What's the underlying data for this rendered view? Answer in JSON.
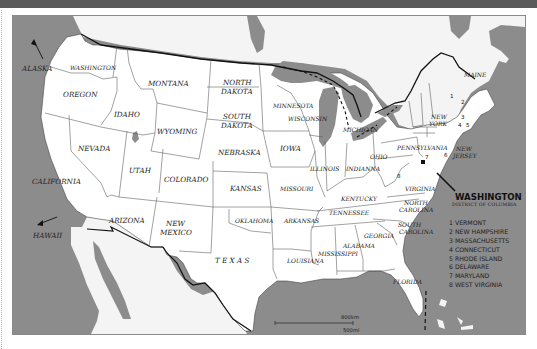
{
  "colors": {
    "water": "#8c8c8c",
    "land": "#ffffff",
    "foreign_land": "#f4f4f4",
    "border": "#555555",
    "national_border": "#111111",
    "header_bar": "#5a5a5a"
  },
  "map": {
    "title": "United States of America",
    "outside_labels": {
      "alaska": "ALASKA",
      "hawaii": "HAWAII"
    },
    "states": {
      "washington": "WASHINGTON",
      "oregon": "OREGON",
      "california": "CALIFORNIA",
      "nevada": "NEVADA",
      "idaho": "IDAHO",
      "montana": "MONTANA",
      "wyoming": "WYOMING",
      "utah": "UTAH",
      "arizona": "ARIZONA",
      "colorado": "COLORADO",
      "new_mexico_1": "NEW",
      "new_mexico_2": "MEXICO",
      "north_dakota_1": "NORTH",
      "north_dakota_2": "DAKOTA",
      "south_dakota_1": "SOUTH",
      "south_dakota_2": "DAKOTA",
      "nebraska": "NEBRASKA",
      "kansas": "KANSAS",
      "oklahoma": "OKLAHOMA",
      "texas": "T E X A S",
      "minnesota": "MINNESOTA",
      "iowa": "IOWA",
      "missouri": "MISSOURI",
      "arkansas": "ARKANSAS",
      "louisiana": "LOUISIANA",
      "wisconsin": "WISCONSIN",
      "illinois": "ILLINOIS",
      "michigan": "MICHIGAN",
      "indiana": "INDIANNA",
      "ohio": "OHIO",
      "kentucky": "KENTUCKY",
      "tennessee": "TENNESSEE",
      "mississippi": "MISSISSIPPI",
      "alabama": "ALABAMA",
      "georgia": "GEORGIA",
      "florida": "FLORIDA",
      "south_carolina_1": "SOUTH",
      "south_carolina_2": "CAROLINA",
      "north_carolina_1": "NORTH",
      "north_carolina_2": "CAROLINA",
      "virginia": "VIRGINIA",
      "pennsylvania": "PENNSYLVANIA",
      "new_york_1": "NEW",
      "new_york_2": "YORK",
      "new_jersey_1": "NEW",
      "new_jersey_2": "JERSEY",
      "maine": "MAINE"
    },
    "state_numbers": {
      "n1": "1",
      "n2": "2",
      "n3": "3",
      "n4": "4",
      "n5": "5",
      "n6": "6",
      "n7": "7",
      "n8": "8"
    },
    "capital": {
      "title": "WASHINGTON",
      "subtitle": "DISTRICT OF COLUMBIA"
    },
    "legend": {
      "items": [
        {
          "num": "1",
          "name": "VERMONT"
        },
        {
          "num": "2",
          "name": "NEW HAMPSHIRE"
        },
        {
          "num": "3",
          "name": "MASSACHUSETTS"
        },
        {
          "num": "4",
          "name": "CONNECTICUT"
        },
        {
          "num": "5",
          "name": "RHODE ISLAND"
        },
        {
          "num": "6",
          "name": "DELAWARE"
        },
        {
          "num": "7",
          "name": "MARYLAND"
        },
        {
          "num": "8",
          "name": "WEST VIRGINIA"
        }
      ]
    },
    "scale": {
      "km": "800km",
      "mi": "500mi"
    }
  }
}
